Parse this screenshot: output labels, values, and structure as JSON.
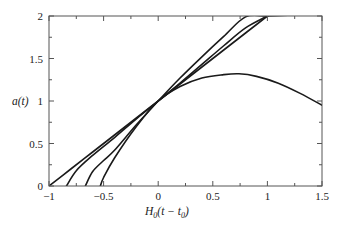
{
  "chart_data": {
    "type": "line",
    "title": "",
    "xlabel": "H0(t − t0)",
    "xlabel_parts": {
      "main": "H",
      "sub0": "0",
      "mid": "(t − t",
      "sub1": "0",
      "end": ")"
    },
    "ylabel": "a(t)",
    "xlim": [
      -1,
      1.5
    ],
    "ylim": [
      0,
      2
    ],
    "x_ticks": [
      -1,
      -0.5,
      0,
      0.5,
      1,
      1.5
    ],
    "x_tick_labels": [
      "−1",
      "−0.5",
      "0",
      "0.5",
      "1",
      "1.5"
    ],
    "y_ticks": [
      0,
      0.5,
      1,
      1.5,
      2
    ],
    "y_tick_labels": [
      "0",
      "0.5",
      "1",
      "1.5",
      "2"
    ],
    "minor_ticks": true,
    "grid": false,
    "legend": "none",
    "line_color": "#1a1a1a",
    "series": [
      {
        "name": "curve-1 (starts at x≈−1.0)",
        "x": [
          -1.0,
          -0.8,
          -0.6,
          -0.4,
          -0.2,
          0.0,
          0.2,
          0.4,
          0.6,
          0.8,
          1.0,
          1.2
        ],
        "y": [
          0.0,
          0.2,
          0.4,
          0.6,
          0.8,
          1.0,
          1.2,
          1.4,
          1.6,
          1.8,
          2.0,
          2.0
        ]
      },
      {
        "name": "curve-2 (starts at x≈−0.84)",
        "x": [
          -0.84,
          -0.75,
          -0.6,
          -0.4,
          -0.2,
          0.0,
          0.2,
          0.4,
          0.6,
          0.8,
          1.0
        ],
        "y": [
          0.0,
          0.18,
          0.36,
          0.57,
          0.79,
          1.0,
          1.21,
          1.43,
          1.65,
          1.86,
          2.0
        ]
      },
      {
        "name": "curve-3 (starts at x≈−0.67)",
        "x": [
          -0.667,
          -0.6,
          -0.5,
          -0.4,
          -0.2,
          0.0,
          0.2,
          0.4,
          0.6,
          0.8,
          1.0,
          1.2
        ],
        "y": [
          0.0,
          0.17,
          0.3,
          0.42,
          0.72,
          1.0,
          1.27,
          1.52,
          1.76,
          1.99,
          2.0,
          2.0
        ]
      },
      {
        "name": "curve-4 (starts at x≈−0.53, recollapses)",
        "x": [
          -0.53,
          -0.5,
          -0.4,
          -0.2,
          0.0,
          0.2,
          0.4,
          0.6,
          0.74,
          0.9,
          1.1,
          1.3,
          1.5
        ],
        "y": [
          0.0,
          0.1,
          0.33,
          0.7,
          1.0,
          1.17,
          1.27,
          1.31,
          1.32,
          1.29,
          1.21,
          1.09,
          0.95
        ]
      }
    ]
  },
  "plot": {
    "ylabel": "a(t)"
  }
}
